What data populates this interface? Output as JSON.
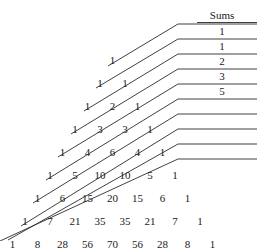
{
  "figure": {
    "background_color": "#ffffff",
    "line_color": "#2b2b2b",
    "text_color": "#1a1a1a"
  },
  "sums_header": {
    "label": "Sums",
    "x": 222,
    "y": 15,
    "rule": {
      "x1": 197,
      "x2": 257,
      "y": 22
    }
  },
  "chart_data": {
    "type": "table",
    "xlabel": "",
    "ylabel": "",
    "row_label": "Pascal row n",
    "rows": [
      {
        "n": 0,
        "values": [
          1
        ]
      },
      {
        "n": 1,
        "values": [
          1,
          1
        ]
      },
      {
        "n": 2,
        "values": [
          1,
          2,
          1
        ]
      },
      {
        "n": 3,
        "values": [
          1,
          3,
          3,
          1
        ]
      },
      {
        "n": 4,
        "values": [
          1,
          4,
          6,
          4,
          1
        ]
      },
      {
        "n": 5,
        "values": [
          1,
          5,
          10,
          10,
          5,
          1
        ]
      },
      {
        "n": 6,
        "values": [
          1,
          6,
          15,
          20,
          15,
          6,
          1
        ]
      },
      {
        "n": 7,
        "values": [
          1,
          7,
          21,
          35,
          35,
          21,
          7,
          1
        ]
      },
      {
        "n": 8,
        "values": [
          1,
          8,
          28,
          56,
          70,
          56,
          28,
          8,
          1
        ]
      }
    ],
    "diagonal_sums_label": "Sums",
    "diagonal_sums": [
      1,
      1,
      2,
      3,
      5
    ],
    "diagonal_sums_unlabeled_count": 5,
    "annotations": [
      "Shallow diagonals of Pascal's triangle sum to the Fibonacci numbers",
      "Only the first five diagonal sums are labelled: 1, 1, 2, 3, 5"
    ],
    "grid": false,
    "legend": "none"
  },
  "layout": {
    "rows": [
      {
        "y": 60,
        "start_x": 112.5,
        "step": 25
      },
      {
        "y": 83,
        "start_x": 100.0,
        "step": 25
      },
      {
        "y": 106,
        "start_x": 87.5,
        "step": 25
      },
      {
        "y": 129,
        "start_x": 75.0,
        "step": 25
      },
      {
        "y": 152,
        "start_x": 62.5,
        "step": 25
      },
      {
        "y": 175,
        "start_x": 50.0,
        "step": 25
      },
      {
        "y": 198,
        "start_x": 37.5,
        "step": 25
      },
      {
        "y": 221,
        "start_x": 25.0,
        "step": 25
      },
      {
        "y": 244,
        "start_x": 12.5,
        "step": 25
      }
    ],
    "sum_values": [
      {
        "value": 1,
        "x": 222,
        "y": 31
      },
      {
        "value": 1,
        "x": 222,
        "y": 46
      },
      {
        "value": 2,
        "x": 222,
        "y": 61
      },
      {
        "value": 3,
        "x": 222,
        "y": 76
      },
      {
        "value": 5,
        "x": 222,
        "y": 91
      }
    ],
    "sum_rules": [
      {
        "x1": 180,
        "x2": 257,
        "y": 24
      },
      {
        "x1": 180,
        "x2": 257,
        "y": 39
      },
      {
        "x1": 180,
        "x2": 257,
        "y": 54
      },
      {
        "x1": 180,
        "x2": 257,
        "y": 69
      },
      {
        "x1": 180,
        "x2": 257,
        "y": 84
      },
      {
        "x1": 180,
        "x2": 257,
        "y": 99
      },
      {
        "x1": 180,
        "x2": 257,
        "y": 114
      },
      {
        "x1": 180,
        "x2": 257,
        "y": 129
      },
      {
        "x1": 180,
        "x2": 257,
        "y": 144
      },
      {
        "x1": 180,
        "x2": 257,
        "y": 159
      }
    ],
    "elbows": [
      {
        "bend_x": 178,
        "bend_y": 24,
        "tail_x": 108,
        "tail_y": 66
      },
      {
        "bend_x": 178,
        "bend_y": 39,
        "tail_x": 96,
        "tail_y": 88
      },
      {
        "bend_x": 178,
        "bend_y": 54,
        "tail_x": 84,
        "tail_y": 111
      },
      {
        "bend_x": 178,
        "bend_y": 69,
        "tail_x": 71,
        "tail_y": 134
      },
      {
        "bend_x": 178,
        "bend_y": 84,
        "tail_x": 58,
        "tail_y": 157
      },
      {
        "bend_x": 178,
        "bend_y": 99,
        "tail_x": 46,
        "tail_y": 180
      },
      {
        "bend_x": 178,
        "bend_y": 114,
        "tail_x": 33,
        "tail_y": 203
      },
      {
        "bend_x": 178,
        "bend_y": 129,
        "tail_x": 21,
        "tail_y": 226
      },
      {
        "bend_x": 178,
        "bend_y": 144,
        "tail_x": 8,
        "tail_y": 240
      },
      {
        "bend_x": 178,
        "bend_y": 159,
        "tail_x": 0,
        "tail_y": 241
      }
    ]
  }
}
